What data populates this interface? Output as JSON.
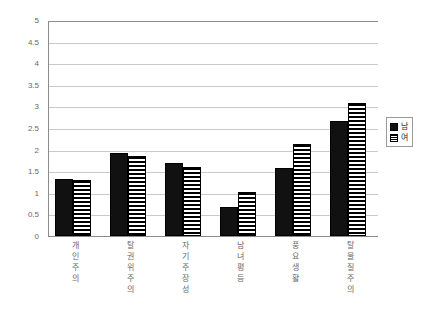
{
  "chart_data": {
    "type": "bar",
    "title": "",
    "subtitle": "",
    "xlabel": "",
    "ylabel": "",
    "ylim": [
      0,
      5
    ],
    "ytick_step": 0.5,
    "yticks": [
      "5",
      "4.5",
      "4",
      "3.5",
      "3",
      "2.5",
      "2",
      "1.5",
      "1",
      "0.5",
      "0"
    ],
    "ytick_values": [
      5,
      4.5,
      4,
      3.5,
      3,
      2.5,
      2,
      1.5,
      1,
      0.5,
      0
    ],
    "grid": true,
    "grid_axis": "y",
    "legend_position": "right",
    "categories": [
      "개인주의",
      "탈권위주의",
      "자기주장성",
      "남녀평등",
      "풍요생활",
      "탈물질주의"
    ],
    "series": [
      {
        "name": "남",
        "color": "#111111",
        "pattern": "solid",
        "values": [
          1.31,
          1.92,
          1.68,
          0.67,
          1.58,
          2.67
        ]
      },
      {
        "name": "여",
        "color": "#ffffff",
        "pattern": "horizontal-hatch",
        "values": [
          1.29,
          1.86,
          1.6,
          1.03,
          2.13,
          3.08
        ]
      }
    ]
  },
  "legend": {
    "items": [
      {
        "label": "남",
        "swatch": "solid-black-swatch"
      },
      {
        "label": "여",
        "swatch": "hatched-swatch"
      }
    ]
  }
}
